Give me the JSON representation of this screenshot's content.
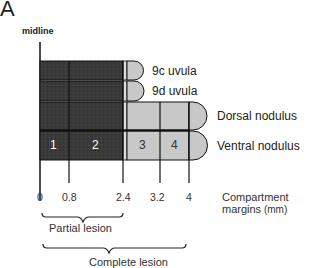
{
  "panel": {
    "label": "A"
  },
  "midline": {
    "label": "midline"
  },
  "rows": [
    {
      "label": "9c uvula"
    },
    {
      "label": "9d uvula"
    },
    {
      "label": "Dorsal nodulus"
    },
    {
      "label": "Ventral nodulus"
    }
  ],
  "compartments": [
    "1",
    "2",
    "3",
    "4"
  ],
  "axis": {
    "ticks": [
      "0",
      "0.8",
      "2.4",
      "3.2",
      "4"
    ],
    "title_line1": "Compartment",
    "title_line2": "margins",
    "title_unit": "(mm)"
  },
  "lesions": {
    "partial": "Partial lesion",
    "complete": "Complete lesion"
  },
  "colors": {
    "dark_fill": "#3a3a3a",
    "light_fill": "#c8c8c8",
    "outline": "#111111"
  }
}
